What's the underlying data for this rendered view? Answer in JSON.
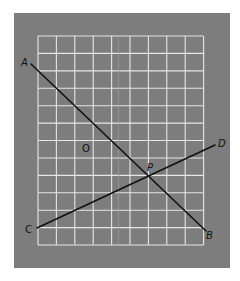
{
  "diagram": {
    "type": "coordinate-grid-with-intersecting-lines",
    "panel": {
      "x": 14,
      "y": 13,
      "width": 216,
      "height": 255,
      "color": "#7d7d7d"
    },
    "grid": {
      "x0": 38,
      "y0": 36,
      "columns": 9,
      "rows": 12,
      "cell_width": 18.4,
      "cell_height": 17.42,
      "line_color": "#e6e6e6"
    },
    "segments": [
      {
        "name": "AB",
        "from": "A",
        "to": "B",
        "x1": 31,
        "y1": 64,
        "x2": 206,
        "y2": 231
      },
      {
        "name": "CD",
        "from": "C",
        "to": "D",
        "x1": 37,
        "y1": 228,
        "x2": 215,
        "y2": 145
      }
    ],
    "points": [
      {
        "id": "A",
        "label": "A",
        "x": 21,
        "y": 66,
        "italic": true
      },
      {
        "id": "B",
        "label": "B",
        "x": 206,
        "y": 239,
        "italic": true
      },
      {
        "id": "C",
        "label": "C",
        "x": 25,
        "y": 233,
        "italic": false
      },
      {
        "id": "D",
        "label": "D",
        "x": 218,
        "y": 147,
        "italic": true
      },
      {
        "id": "O",
        "label": "O",
        "x": 82,
        "y": 152,
        "italic": false
      },
      {
        "id": "P",
        "label": "P",
        "x": 147,
        "y": 171,
        "italic": true
      }
    ],
    "intersection": {
      "label": "P",
      "x": 147,
      "y": 177
    }
  }
}
